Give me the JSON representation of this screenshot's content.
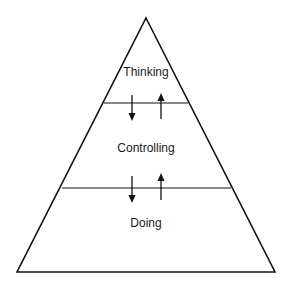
{
  "diagram": {
    "type": "pyramid",
    "stroke_color": "#111111",
    "background": "#ffffff",
    "levels": [
      {
        "label": "Thinking",
        "position": "top"
      },
      {
        "label": "Controlling",
        "position": "middle"
      },
      {
        "label": "Doing",
        "position": "bottom"
      }
    ],
    "arrows": [
      {
        "between": [
          "Thinking",
          "Controlling"
        ],
        "directions": [
          "down",
          "up"
        ]
      },
      {
        "between": [
          "Controlling",
          "Doing"
        ],
        "directions": [
          "down",
          "up"
        ]
      }
    ]
  }
}
